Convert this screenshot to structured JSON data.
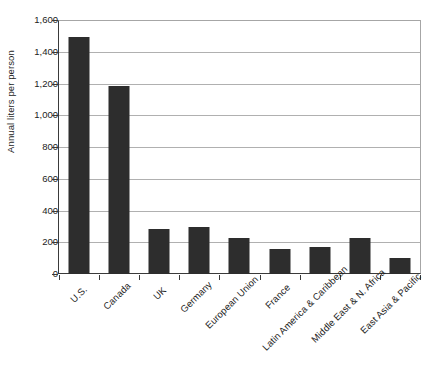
{
  "chart_data": {
    "type": "bar",
    "title": "",
    "xlabel": "",
    "ylabel": "Annual liters per person",
    "ylim": [
      0,
      1600
    ],
    "ytick_step": 200,
    "grid": true,
    "legend": "none",
    "bar_color": "#2d2d2d",
    "categories": [
      "U.S.",
      "Canada",
      "UK",
      "Germany",
      "European Union",
      "France",
      "Latin America & Caribbean",
      "Middle East & N. Africa",
      "East Asia & Pacific"
    ],
    "values": [
      1500,
      1190,
      285,
      300,
      228,
      160,
      172,
      230,
      100
    ],
    "ytick_labels": [
      "0",
      "200",
      "400",
      "600",
      "800",
      "1,000",
      "1,200",
      "1,400",
      "1,600"
    ],
    "ytick_values": [
      0,
      200,
      400,
      600,
      800,
      1000,
      1200,
      1400,
      1600
    ]
  },
  "axes": {
    "y_title": "Annual liters per person"
  },
  "header": {
    "clipped_title": "· · · · · · · ·"
  }
}
